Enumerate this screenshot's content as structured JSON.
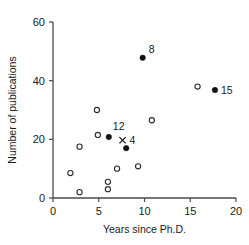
{
  "chart_data": {
    "type": "scatter",
    "title": "",
    "xlabel": "Years since Ph.D.",
    "ylabel": "Number of publications",
    "xlim": [
      0,
      20
    ],
    "ylim": [
      0,
      60
    ],
    "xticks": [
      0,
      5,
      10,
      15,
      20
    ],
    "yticks": [
      0,
      20,
      40,
      60
    ],
    "xtick_labels": [
      "0",
      "5",
      "10",
      "15",
      "20"
    ],
    "ytick_labels": [
      "0",
      "20",
      "40",
      "60"
    ],
    "grid": false,
    "legend": null,
    "series": [
      {
        "name": "unlabeled observations",
        "marker": "open-circle",
        "points": [
          {
            "x": 1.9,
            "y": 8.5
          },
          {
            "x": 2.9,
            "y": 17.5
          },
          {
            "x": 2.9,
            "y": 2.0
          },
          {
            "x": 4.8,
            "y": 30.0
          },
          {
            "x": 4.9,
            "y": 21.5
          },
          {
            "x": 6.0,
            "y": 5.5
          },
          {
            "x": 6.0,
            "y": 3.0
          },
          {
            "x": 7.0,
            "y": 10.0
          },
          {
            "x": 9.3,
            "y": 10.8
          },
          {
            "x": 10.8,
            "y": 26.5
          },
          {
            "x": 15.8,
            "y": 38.0
          }
        ]
      },
      {
        "name": "labeled observations",
        "marker": "filled-circle",
        "points": [
          {
            "x": 6.1,
            "y": 20.8,
            "label": "12",
            "label_dx": 4,
            "label_dy": -7
          },
          {
            "x": 8.0,
            "y": 17.0,
            "label": "",
            "label_dx": 0,
            "label_dy": 0
          },
          {
            "x": 9.8,
            "y": 47.8,
            "label": "8",
            "label_dx": 6,
            "label_dy": -5
          },
          {
            "x": 17.7,
            "y": 36.8,
            "label": "15",
            "label_dx": 6,
            "label_dy": 4
          }
        ]
      },
      {
        "name": "cross observation",
        "marker": "x",
        "points": [
          {
            "x": 7.6,
            "y": 19.7,
            "label": "4",
            "label_dx": 7,
            "label_dy": 4
          }
        ]
      }
    ],
    "annotations": [
      "12",
      "8",
      "15",
      "4"
    ],
    "colors": {
      "axis": "#4a4a4a",
      "marker_open": "#2b2b2b",
      "marker_filled": "#111111",
      "text": "#1a1a1a",
      "background": "#ffffff"
    }
  }
}
